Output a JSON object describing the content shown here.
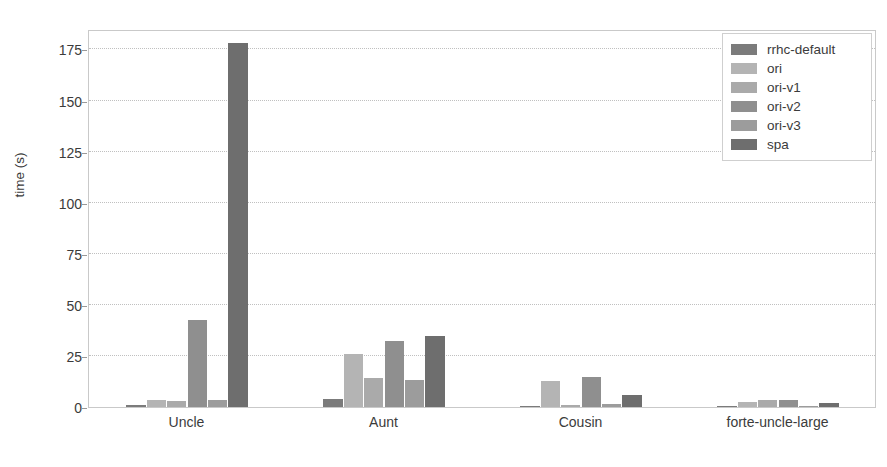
{
  "chart_data": {
    "type": "bar",
    "title": "",
    "xlabel": "",
    "ylabel": "time (s)",
    "ylim": [
      0,
      185
    ],
    "grid": true,
    "legend_position": "upper right",
    "categories": [
      "Uncle",
      "Aunt",
      "Cousin",
      "forte-uncle-large"
    ],
    "yticks": [
      0,
      25,
      50,
      75,
      100,
      125,
      150,
      175
    ],
    "ytick_labels": [
      "0",
      "25",
      "50",
      "75",
      "100",
      "125",
      "150",
      "175"
    ],
    "series": [
      {
        "name": "rrhc-default",
        "color": "#7b7b7b",
        "values": [
          1.2,
          4.0,
          0.6,
          0.5
        ]
      },
      {
        "name": "ori",
        "color": "#b4b4b4",
        "values": [
          3.3,
          26.0,
          12.5,
          2.6
        ]
      },
      {
        "name": "ori-v1",
        "color": "#aaaaaa",
        "values": [
          3.0,
          14.0,
          1.0,
          3.2
        ]
      },
      {
        "name": "ori-v2",
        "color": "#8f8f8f",
        "values": [
          42.5,
          32.5,
          14.5,
          3.6
        ]
      },
      {
        "name": "ori-v3",
        "color": "#9c9c9c",
        "values": [
          3.4,
          13.0,
          1.6,
          0.4
        ]
      },
      {
        "name": "spa",
        "color": "#6e6e6e",
        "values": [
          178.0,
          35.0,
          6.0,
          2.0
        ]
      }
    ]
  },
  "legend": {
    "entries": [
      {
        "label": "rrhc-default"
      },
      {
        "label": "ori"
      },
      {
        "label": "ori-v1"
      },
      {
        "label": "ori-v2"
      },
      {
        "label": "ori-v3"
      },
      {
        "label": "spa"
      }
    ]
  }
}
